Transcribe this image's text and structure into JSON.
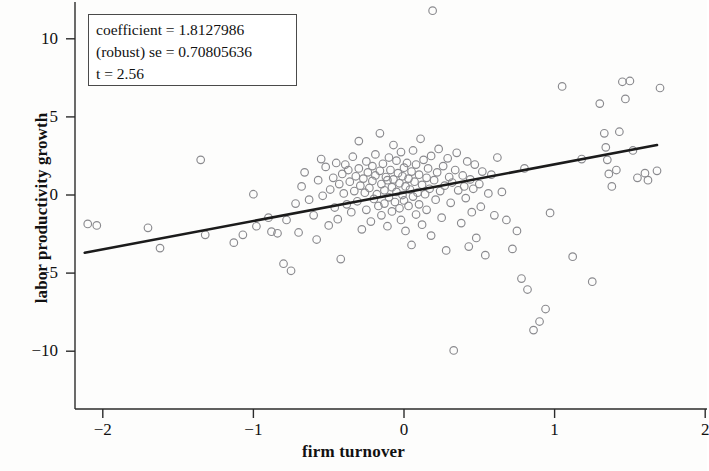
{
  "chart_data": {
    "type": "scatter",
    "title": "",
    "xlabel": "firm turnover",
    "ylabel": "labor productivity growth",
    "xlim": [
      -2.2,
      2.0
    ],
    "ylim": [
      -11.2,
      12.3
    ],
    "xticks": [
      -2,
      -1,
      0,
      1,
      2
    ],
    "xticklabels": [
      "−2",
      "−1",
      "0",
      "1",
      "2"
    ],
    "yticks": [
      10,
      5,
      0,
      -5,
      -10
    ],
    "yticklabels": [
      "10",
      "5",
      "0",
      "−5",
      "−10"
    ],
    "grid": false,
    "legend": null,
    "marker": "open-circle",
    "marker_color": "#8a8a8e",
    "fit_line": {
      "type": "linear",
      "slope": 1.8127986,
      "intercept": 0.15,
      "x_start": -2.12,
      "x_end": 1.68,
      "color": "#1b1b1b",
      "width": 2.6
    },
    "points": [
      [
        -2.1,
        -1.85
      ],
      [
        -2.04,
        -1.95
      ],
      [
        -1.7,
        -2.1
      ],
      [
        -1.62,
        -3.4
      ],
      [
        -1.35,
        2.25
      ],
      [
        -1.32,
        -2.55
      ],
      [
        -1.13,
        -3.05
      ],
      [
        -1.07,
        -2.55
      ],
      [
        -1.0,
        0.05
      ],
      [
        -0.98,
        -2.0
      ],
      [
        -0.9,
        -1.45
      ],
      [
        -0.88,
        -2.35
      ],
      [
        -0.84,
        -2.45
      ],
      [
        -0.8,
        -4.4
      ],
      [
        -0.78,
        -1.6
      ],
      [
        -0.75,
        -4.85
      ],
      [
        -0.72,
        -0.55
      ],
      [
        -0.7,
        -2.4
      ],
      [
        -0.68,
        0.55
      ],
      [
        -0.66,
        1.45
      ],
      [
        -0.63,
        -0.3
      ],
      [
        -0.6,
        -1.3
      ],
      [
        -0.58,
        -2.85
      ],
      [
        -0.57,
        0.95
      ],
      [
        -0.55,
        2.3
      ],
      [
        -0.54,
        -0.05
      ],
      [
        -0.52,
        1.8
      ],
      [
        -0.5,
        -1.95
      ],
      [
        -0.49,
        0.35
      ],
      [
        -0.47,
        1.1
      ],
      [
        -0.46,
        -0.8
      ],
      [
        -0.45,
        2.05
      ],
      [
        -0.44,
        -1.55
      ],
      [
        -0.43,
        0.7
      ],
      [
        -0.42,
        -4.1
      ],
      [
        -0.41,
        1.35
      ],
      [
        -0.4,
        0.1
      ],
      [
        -0.39,
        1.95
      ],
      [
        -0.38,
        -0.6
      ],
      [
        -0.37,
        1.6
      ],
      [
        -0.36,
        0.85
      ],
      [
        -0.35,
        -1.1
      ],
      [
        -0.34,
        2.45
      ],
      [
        -0.33,
        0.25
      ],
      [
        -0.32,
        1.2
      ],
      [
        -0.31,
        -0.4
      ],
      [
        -0.3,
        3.45
      ],
      [
        -0.3,
        1.7
      ],
      [
        -0.29,
        0.6
      ],
      [
        -0.28,
        -2.2
      ],
      [
        -0.27,
        1.05
      ],
      [
        -0.26,
        0.15
      ],
      [
        -0.25,
        2.15
      ],
      [
        -0.25,
        -0.95
      ],
      [
        -0.24,
        1.45
      ],
      [
        -0.23,
        0.45
      ],
      [
        -0.22,
        -1.7
      ],
      [
        -0.21,
        1.85
      ],
      [
        -0.21,
        0.9
      ],
      [
        -0.2,
        -0.25
      ],
      [
        -0.19,
        2.6
      ],
      [
        -0.19,
        1.25
      ],
      [
        -0.18,
        0.05
      ],
      [
        -0.17,
        -0.7
      ],
      [
        -0.16,
        1.55
      ],
      [
        -0.16,
        3.95
      ],
      [
        -0.15,
        0.7
      ],
      [
        -0.15,
        -1.3
      ],
      [
        -0.14,
        2.0
      ],
      [
        -0.13,
        0.3
      ],
      [
        -0.13,
        -0.55
      ],
      [
        -0.12,
        1.15
      ],
      [
        -0.11,
        -2.0
      ],
      [
        -0.11,
        0.95
      ],
      [
        -0.1,
        2.4
      ],
      [
        -0.1,
        -0.15
      ],
      [
        -0.09,
        1.6
      ],
      [
        -0.08,
        0.5
      ],
      [
        -0.08,
        -1.05
      ],
      [
        -0.07,
        3.2
      ],
      [
        -0.07,
        1.0
      ],
      [
        -0.06,
        -0.45
      ],
      [
        -0.05,
        2.2
      ],
      [
        -0.05,
        0.2
      ],
      [
        -0.04,
        1.4
      ],
      [
        -0.03,
        -0.85
      ],
      [
        -0.03,
        0.75
      ],
      [
        -0.02,
        2.75
      ],
      [
        -0.02,
        -1.6
      ],
      [
        -0.01,
        1.2
      ],
      [
        -0.01,
        0.0
      ],
      [
        0.0,
        1.75
      ],
      [
        0.0,
        -0.35
      ],
      [
        0.01,
        0.55
      ],
      [
        0.01,
        -2.3
      ],
      [
        0.02,
        2.05
      ],
      [
        0.03,
        1.05
      ],
      [
        0.03,
        -0.7
      ],
      [
        0.04,
        0.35
      ],
      [
        0.05,
        1.5
      ],
      [
        0.05,
        -3.2
      ],
      [
        0.06,
        2.85
      ],
      [
        0.06,
        -0.1
      ],
      [
        0.07,
        0.85
      ],
      [
        0.08,
        -1.25
      ],
      [
        0.08,
        1.95
      ],
      [
        0.09,
        0.15
      ],
      [
        0.1,
        -0.6
      ],
      [
        0.1,
        1.3
      ],
      [
        0.11,
        3.6
      ],
      [
        0.12,
        0.65
      ],
      [
        0.12,
        -1.9
      ],
      [
        0.13,
        2.25
      ],
      [
        0.14,
        0.05
      ],
      [
        0.15,
        1.1
      ],
      [
        0.15,
        -0.95
      ],
      [
        0.16,
        1.7
      ],
      [
        0.17,
        0.4
      ],
      [
        0.18,
        -2.6
      ],
      [
        0.18,
        2.5
      ],
      [
        0.19,
        11.8
      ],
      [
        0.2,
        0.95
      ],
      [
        0.21,
        -0.3
      ],
      [
        0.22,
        1.45
      ],
      [
        0.23,
        2.95
      ],
      [
        0.24,
        0.25
      ],
      [
        0.25,
        -1.45
      ],
      [
        0.26,
        1.85
      ],
      [
        0.27,
        0.6
      ],
      [
        0.28,
        -3.55
      ],
      [
        0.29,
        2.35
      ],
      [
        0.3,
        1.15
      ],
      [
        0.31,
        -0.5
      ],
      [
        0.32,
        0.8
      ],
      [
        0.33,
        -9.95
      ],
      [
        0.34,
        1.6
      ],
      [
        0.35,
        2.7
      ],
      [
        0.36,
        0.3
      ],
      [
        0.38,
        -1.8
      ],
      [
        0.39,
        1.25
      ],
      [
        0.4,
        0.55
      ],
      [
        0.41,
        -0.2
      ],
      [
        0.42,
        2.15
      ],
      [
        0.43,
        -3.3
      ],
      [
        0.44,
        1.0
      ],
      [
        0.45,
        -1.1
      ],
      [
        0.46,
        0.4
      ],
      [
        0.47,
        1.95
      ],
      [
        0.48,
        -2.75
      ],
      [
        0.5,
        0.7
      ],
      [
        0.51,
        -0.75
      ],
      [
        0.52,
        1.5
      ],
      [
        0.54,
        -3.85
      ],
      [
        0.56,
        0.1
      ],
      [
        0.58,
        1.3
      ],
      [
        0.6,
        -1.3
      ],
      [
        0.62,
        2.4
      ],
      [
        0.65,
        0.2
      ],
      [
        0.68,
        -1.6
      ],
      [
        0.72,
        -3.45
      ],
      [
        0.75,
        -2.3
      ],
      [
        0.78,
        -5.35
      ],
      [
        0.8,
        1.7
      ],
      [
        0.82,
        -6.05
      ],
      [
        0.86,
        -8.65
      ],
      [
        0.9,
        -8.1
      ],
      [
        0.94,
        -7.3
      ],
      [
        0.97,
        -1.15
      ],
      [
        1.05,
        6.95
      ],
      [
        1.12,
        -3.95
      ],
      [
        1.18,
        2.3
      ],
      [
        1.25,
        -5.55
      ],
      [
        1.3,
        5.85
      ],
      [
        1.33,
        3.95
      ],
      [
        1.34,
        3.05
      ],
      [
        1.35,
        2.25
      ],
      [
        1.36,
        1.35
      ],
      [
        1.38,
        0.55
      ],
      [
        1.41,
        1.6
      ],
      [
        1.43,
        4.05
      ],
      [
        1.45,
        7.25
      ],
      [
        1.47,
        6.15
      ],
      [
        1.5,
        7.3
      ],
      [
        1.52,
        2.85
      ],
      [
        1.55,
        1.1
      ],
      [
        1.6,
        1.4
      ],
      [
        1.62,
        0.95
      ],
      [
        1.68,
        1.55
      ],
      [
        1.7,
        6.85
      ]
    ]
  },
  "annotation_box": {
    "line1": "coefficient = 1.8127986",
    "line2": "(robust) se = 0.70805636",
    "line3": "t = 2.56"
  }
}
